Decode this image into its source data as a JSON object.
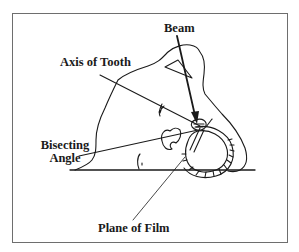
{
  "diagram": {
    "labels": {
      "beam": "Beam",
      "axis_of_tooth": "Axis of Tooth",
      "bisecting_angle_line1": "Bisecting",
      "bisecting_angle_line2": "Angle",
      "plane_of_film": "Plane of Film"
    },
    "colors": {
      "stroke": "#1a1a1a",
      "frame": "#6e6e6e",
      "background": "#ffffff"
    }
  }
}
